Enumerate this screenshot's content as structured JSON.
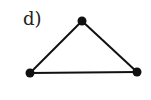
{
  "diagram": {
    "label": "d)",
    "type": "graph",
    "nodes": [
      {
        "id": "top",
        "x": 82,
        "y": 21
      },
      {
        "id": "left",
        "x": 30,
        "y": 73
      },
      {
        "id": "right",
        "x": 137,
        "y": 72
      }
    ],
    "edges": [
      [
        "top",
        "left"
      ],
      [
        "top",
        "right"
      ],
      [
        "left",
        "right"
      ]
    ],
    "colors": {
      "stroke": "#111111",
      "node": "#111111",
      "background": "#ffffff"
    }
  }
}
